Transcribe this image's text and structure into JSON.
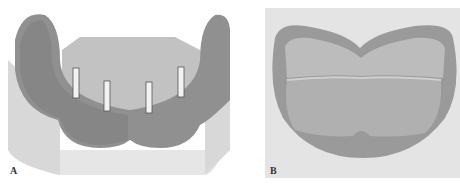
{
  "figure": {
    "panels": [
      {
        "id": "A",
        "label": "A",
        "description": "Mandibular cast with four parallel implant abutment posts on an edentulous ridge"
      },
      {
        "id": "B",
        "label": "B",
        "description": "Occlusal view of lower denture base / tissue surface"
      }
    ]
  },
  "colors": {
    "background": "#ffffff",
    "cast_base": "#e6e6e6",
    "cast_shadow": "#cfcfcf",
    "gum_tissue": "#8f8f8f",
    "gum_dark": "#6e6e6e",
    "palate_plate": "#bdbdbd",
    "post": "#f2f2f2",
    "panel_b_bg": "#e4e4e4",
    "denture_outer": "#9a9a9a",
    "denture_inner": "#c4c4c4"
  }
}
